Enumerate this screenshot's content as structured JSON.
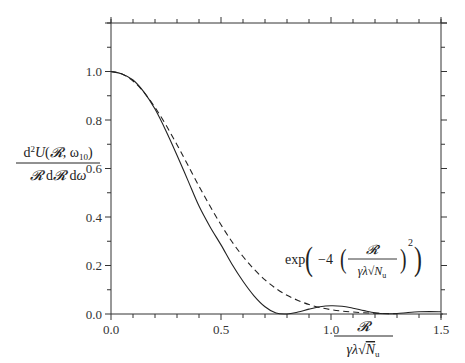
{
  "chart_data": {
    "type": "line",
    "title": "",
    "xlabel": "R / (γλ√N_u)",
    "ylabel": "d²U(R, ω10) / (R dR dω)",
    "xlim": [
      0.0,
      1.5
    ],
    "ylim": [
      0.0,
      1.2
    ],
    "grid": false,
    "x_ticks": [
      "0.0",
      "0.5",
      "1.0",
      "1.5"
    ],
    "y_ticks": [
      "0.0",
      "0.2",
      "0.4",
      "0.6",
      "0.8",
      "1.0"
    ],
    "x_minor_step": 0.1,
    "y_minor_step": 0.1,
    "legend": null,
    "annotations": [
      {
        "text": "exp(−4 (R / (γλ√N_u))²)",
        "x": 0.93,
        "y": 0.14,
        "refers_to": "Gaussian approximation"
      }
    ],
    "series": [
      {
        "name": "d²U/(R dR dω)",
        "style": "solid",
        "x": [
          0.0,
          0.05,
          0.1,
          0.15,
          0.2,
          0.25,
          0.3,
          0.35,
          0.4,
          0.45,
          0.5,
          0.55,
          0.6,
          0.65,
          0.7,
          0.75,
          0.8,
          0.85,
          0.9,
          0.95,
          1.0,
          1.05,
          1.1,
          1.15,
          1.2,
          1.25,
          1.3,
          1.35,
          1.4,
          1.45,
          1.5
        ],
        "y": [
          1.0,
          0.99,
          0.965,
          0.915,
          0.845,
          0.755,
          0.655,
          0.55,
          0.445,
          0.36,
          0.285,
          0.205,
          0.135,
          0.075,
          0.03,
          0.004,
          0.0,
          0.008,
          0.02,
          0.03,
          0.034,
          0.032,
          0.024,
          0.014,
          0.005,
          0.001,
          0.002,
          0.006,
          0.009,
          0.01,
          0.009
        ]
      },
      {
        "name": "exp(−4x²)",
        "style": "dashed",
        "x": [
          0.0,
          0.05,
          0.1,
          0.15,
          0.2,
          0.25,
          0.3,
          0.35,
          0.4,
          0.45,
          0.5,
          0.55,
          0.6,
          0.65,
          0.7,
          0.75,
          0.8,
          0.85,
          0.9,
          0.95,
          1.0,
          1.05,
          1.1,
          1.15,
          1.2,
          1.25,
          1.3
        ],
        "y": [
          1.0,
          0.99,
          0.961,
          0.914,
          0.852,
          0.779,
          0.698,
          0.613,
          0.527,
          0.445,
          0.368,
          0.298,
          0.237,
          0.185,
          0.141,
          0.105,
          0.077,
          0.056,
          0.039,
          0.027,
          0.018,
          0.012,
          0.008,
          0.005,
          0.003,
          0.002,
          0.001
        ]
      }
    ]
  },
  "labels": {
    "y_axis": {
      "numerator": "d²U(R, ω10)",
      "denominator": "R dR dω"
    },
    "x_axis": {
      "numerator": "R",
      "denominator": "γλ√N_u"
    },
    "annotation": "exp(−4 (R / (γλ√N_u))²)"
  }
}
